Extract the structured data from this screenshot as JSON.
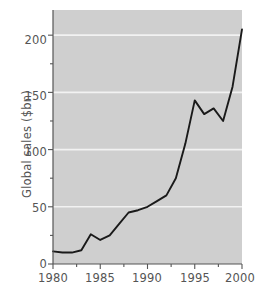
{
  "chart_data": {
    "type": "line",
    "title": "",
    "xlabel": "",
    "ylabel": "Global sales ($bn)",
    "xlim": [
      1980,
      2000
    ],
    "ylim": [
      0,
      222
    ],
    "grid": true,
    "legend": "none",
    "x_ticks": [
      "1980",
      "1985",
      "1990",
      "1995",
      "2000"
    ],
    "x_tick_values": [
      1980,
      1985,
      1990,
      1995,
      2000
    ],
    "x_minor_ticks": [
      1982.5,
      1987.5,
      1992.5,
      1997.5
    ],
    "y_ticks": [
      "0",
      "50",
      "100",
      "150",
      "200"
    ],
    "y_tick_values": [
      0,
      50,
      100,
      150,
      200
    ],
    "y_minor_ticks": [
      25,
      75,
      125,
      175
    ],
    "gridline_values": [
      50,
      100,
      150,
      200
    ],
    "x": [
      1980,
      1981,
      1982,
      1983,
      1984,
      1985,
      1986,
      1987,
      1988,
      1989,
      1990,
      1991,
      1992,
      1993,
      1994,
      1995,
      1996,
      1997,
      1998,
      1999,
      2000
    ],
    "values": [
      11,
      10,
      10,
      12,
      26,
      21,
      25,
      35,
      45,
      47,
      50,
      55,
      60,
      75,
      105,
      143,
      131,
      136,
      125,
      155,
      205
    ],
    "series": [
      {
        "name": "Global sales",
        "values": [
          11,
          10,
          10,
          12,
          26,
          21,
          25,
          35,
          45,
          47,
          50,
          55,
          60,
          75,
          105,
          143,
          131,
          136,
          125,
          155,
          205
        ]
      }
    ],
    "colors": {
      "line": "#1a1a1a",
      "plot_background": "#cfcfcf",
      "gridline": "#f2f2f2",
      "axis": "#555555",
      "figure_background": "#ffffff",
      "text": "#555555"
    }
  },
  "axes": {
    "y_label": "Global sales ($bn)",
    "y_tick_labels": [
      "0",
      "50",
      "100",
      "150",
      "200"
    ],
    "x_tick_labels": [
      "1980",
      "1985",
      "1990",
      "1995",
      "2000"
    ]
  }
}
